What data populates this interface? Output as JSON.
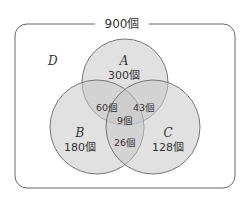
{
  "diagram": {
    "type": "venn",
    "universe": {
      "label": "D",
      "total": "900個"
    },
    "sets": [
      {
        "name": "A",
        "count": "300個"
      },
      {
        "name": "B",
        "count": "180個"
      },
      {
        "name": "C",
        "count": "128個"
      }
    ],
    "intersections": {
      "AB": "60個",
      "AC": "43個",
      "ABC": "9個",
      "BC": "26個"
    },
    "colors": {
      "fill": "#d9d9d9",
      "stroke": "#777777",
      "frame": "#666666"
    }
  }
}
